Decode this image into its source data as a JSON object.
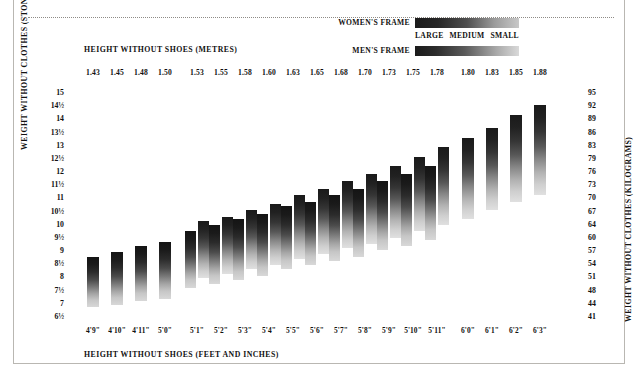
{
  "legend": {
    "women_label": "WOMEN'S FRAME",
    "men_label": "MEN'S FRAME",
    "sizes": [
      "LARGE",
      "MEDIUM",
      "SMALL"
    ]
  },
  "axis_titles": {
    "top": "HEIGHT WITHOUT SHOES (METRES)",
    "bottom": "HEIGHT WITHOUT SHOES (FEET AND INCHES)",
    "left": "WEIGHT WITHOUT CLOTHES (STONES)",
    "right": "WEIGHT WITHOUT CLOTHES (KILOGRAMS)"
  },
  "chart_data": {
    "type": "bar",
    "title": "",
    "xlabel": "HEIGHT WITHOUT SHOES (METRES)",
    "ylabel": "WEIGHT WITHOUT CLOTHES (STONES)",
    "grid": false,
    "legend_position": "top-right",
    "categories_metres": [
      "1.43",
      "1.45",
      "1.48",
      "1.50",
      "1.53",
      "1.55",
      "1.58",
      "1.60",
      "1.63",
      "1.65",
      "1.68",
      "1.70",
      "1.73",
      "1.75",
      "1.78",
      "1.80",
      "1.83",
      "1.85",
      "1.88"
    ],
    "categories_feet": [
      "4'9\"",
      "4'10\"",
      "4'11\"",
      "5'0\"",
      "5'1\"",
      "5'2\"",
      "5'3\"",
      "5'4\"",
      "5'5\"",
      "5'6\"",
      "5'7\"",
      "5'8\"",
      "5'9\"",
      "5'10\"",
      "5'11\"",
      "6'0\"",
      "6'1\"",
      "6'2\"",
      "6'3\""
    ],
    "ylim_stones": [
      6.5,
      15
    ],
    "ylim_kg": [
      41,
      95
    ],
    "yticks_stones": [
      "15",
      "14½",
      "14",
      "13½",
      "13",
      "12½",
      "12",
      "11½",
      "11",
      "10½",
      "10",
      "9½",
      "9",
      "8½",
      "8",
      "7½",
      "7",
      "6½"
    ],
    "yticks_kg": [
      "95",
      "92",
      "89",
      "86",
      "83",
      "79",
      "76",
      "73",
      "70",
      "67",
      "64",
      "60",
      "57",
      "54",
      "51",
      "48",
      "44",
      "41"
    ],
    "series": [
      {
        "name": "WOMEN'S FRAME",
        "range_kg": [
          [
            44.0,
            56.0
          ],
          [
            44.5,
            57.0
          ],
          [
            45.5,
            58.5
          ],
          [
            46.0,
            59.5
          ],
          [
            48.5,
            62.0
          ],
          [
            49.5,
            63.5
          ],
          [
            50.5,
            65.0
          ],
          [
            51.5,
            66.0
          ],
          [
            53.0,
            68.0
          ],
          [
            54.0,
            69.0
          ],
          [
            55.0,
            70.5
          ],
          [
            56.0,
            72.0
          ],
          [
            57.5,
            74.0
          ],
          [
            58.5,
            75.5
          ],
          [
            60.0,
            77.5
          ],
          [
            null,
            null
          ],
          [
            null,
            null
          ],
          [
            null,
            null
          ],
          [
            null,
            null
          ]
        ]
      },
      {
        "name": "MEN'S FRAME",
        "range_kg": [
          [
            null,
            null
          ],
          [
            null,
            null
          ],
          [
            null,
            null
          ],
          [
            null,
            null
          ],
          [
            51.0,
            64.5
          ],
          [
            52.0,
            65.5
          ],
          [
            53.0,
            67.0
          ],
          [
            54.0,
            68.5
          ],
          [
            55.5,
            70.5
          ],
          [
            56.5,
            72.0
          ],
          [
            58.0,
            74.0
          ],
          [
            59.0,
            75.5
          ],
          [
            60.5,
            77.5
          ],
          [
            62.0,
            79.5
          ],
          [
            63.5,
            82.0
          ],
          [
            65.0,
            84.0
          ],
          [
            67.0,
            86.5
          ],
          [
            69.0,
            89.5
          ],
          [
            70.5,
            92.0
          ]
        ]
      }
    ]
  }
}
